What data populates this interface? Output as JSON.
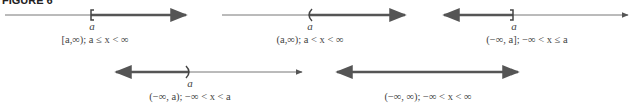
{
  "figure": {
    "title": "FIGURE 6",
    "endpoint_label": "a",
    "colors": {
      "thin_line": "#777777",
      "thick_line": "#555555"
    },
    "intervals": [
      {
        "notation": "[a,∞)",
        "inequality": "a ≤ x < ∞",
        "caption": "[a,∞);  a ≤ x < ∞",
        "endpoint": "closed-left"
      },
      {
        "notation": "(a,∞)",
        "inequality": "a < x < ∞",
        "caption": "(a,∞);  a < x < ∞",
        "endpoint": "open-left"
      },
      {
        "notation": "(−∞, a]",
        "inequality": "−∞ < x ≤ a",
        "caption": "(−∞, a];  −∞ < x ≤ a",
        "endpoint": "closed-right"
      },
      {
        "notation": "(−∞, a)",
        "inequality": "−∞ < x < a",
        "caption": "(−∞, a);  −∞ < x < a",
        "endpoint": "open-right"
      },
      {
        "notation": "(−∞, ∞)",
        "inequality": "−∞ < x < ∞",
        "caption": "(−∞, ∞);  −∞ < x < ∞",
        "endpoint": "none"
      }
    ]
  }
}
